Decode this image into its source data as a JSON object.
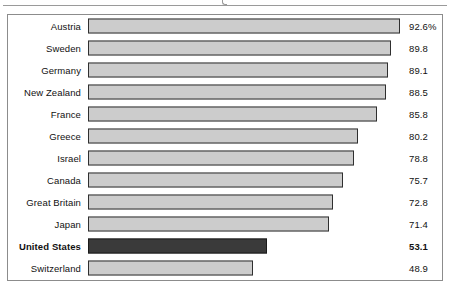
{
  "chart_data": {
    "type": "bar",
    "orientation": "horizontal",
    "title": "",
    "xlabel": "",
    "ylabel": "",
    "xlim": [
      0,
      92.6
    ],
    "grid": false,
    "legend": null,
    "value_suffix_first_row": "%",
    "categories": [
      "Austria",
      "Sweden",
      "Germany",
      "New Zealand",
      "France",
      "Greece",
      "Israel",
      "Canada",
      "Great Britain",
      "Japan",
      "United States",
      "Switzerland"
    ],
    "values": [
      92.6,
      89.8,
      89.1,
      88.5,
      85.8,
      80.2,
      78.8,
      75.7,
      72.8,
      71.4,
      53.1,
      48.9
    ],
    "value_labels": [
      "92.6%",
      "89.8",
      "89.1",
      "88.5",
      "85.8",
      "80.2",
      "78.8",
      "75.7",
      "72.8",
      "71.4",
      "53.1",
      "48.9"
    ],
    "highlighted_category": "United States",
    "colors": {
      "bar_fill": "#cccccc",
      "bar_border": "#2f2f2f",
      "highlight_fill": "#3a3a3a",
      "highlight_border": "#1a1a1a",
      "frame_border": "#8c8c8c",
      "text": "#111111",
      "background": "#ffffff"
    }
  },
  "rows": [
    {
      "label": "Austria",
      "value": "92.6%"
    },
    {
      "label": "Sweden",
      "value": "89.8"
    },
    {
      "label": "Germany",
      "value": "89.1"
    },
    {
      "label": "New Zealand",
      "value": "88.5"
    },
    {
      "label": "France",
      "value": "85.8"
    },
    {
      "label": "Greece",
      "value": "80.2"
    },
    {
      "label": "Israel",
      "value": "78.8"
    },
    {
      "label": "Canada",
      "value": "75.7"
    },
    {
      "label": "Great Britain",
      "value": "72.8"
    },
    {
      "label": "Japan",
      "value": "71.4"
    },
    {
      "label": "United States",
      "value": "53.1"
    },
    {
      "label": "Switzerland",
      "value": "48.9"
    }
  ]
}
